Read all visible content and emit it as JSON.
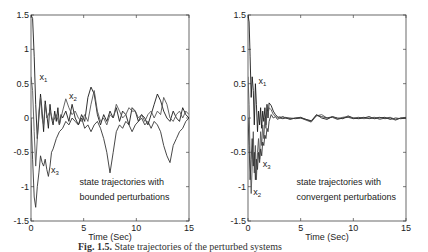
{
  "caption": {
    "prefix": "Fig. 1.5.",
    "text": "State trajectories of the perturbed systems"
  },
  "chart_data": [
    {
      "type": "line",
      "title": "",
      "xlabel": "Time (Sec)",
      "ylabel": "",
      "xlim": [
        0,
        15
      ],
      "ylim": [
        -1.5,
        1.5
      ],
      "xticks": [
        0,
        5,
        10,
        15
      ],
      "xtick_labels": [
        "0",
        "5",
        "10",
        "15"
      ],
      "yticks": [
        1.5,
        1,
        0.5,
        0,
        -0.5,
        -1,
        -1.5
      ],
      "ytick_labels": [
        "1.5",
        "1",
        "0.5",
        "0",
        "-0.5",
        "-1",
        "-1.5"
      ],
      "grid": false,
      "annotation": [
        "state trajectories with",
        "bounded perturbations"
      ],
      "series_labels": [
        {
          "name": "x",
          "sub": "1",
          "at": [
            0.8,
            0.55
          ]
        },
        {
          "name": "x",
          "sub": "2",
          "at": [
            3.6,
            0.28
          ]
        },
        {
          "name": "x",
          "sub": "3",
          "at": [
            1.9,
            -0.8
          ]
        }
      ],
      "series": [
        {
          "name": "x1",
          "x": [
            0,
            0.15,
            0.3,
            0.45,
            0.6,
            0.75,
            0.9,
            1.05,
            1.2,
            1.35,
            1.5,
            1.65,
            1.8,
            1.95,
            2.1,
            2.25,
            2.4,
            2.55,
            2.7,
            2.85,
            3.0,
            3.3,
            3.6,
            3.9,
            4.2,
            4.5,
            4.8,
            5.1,
            5.4,
            5.7,
            6.0,
            6.3,
            6.6,
            6.9,
            7.2,
            7.5,
            7.8,
            8.1,
            8.4,
            8.7,
            9.0,
            9.3,
            9.6,
            9.9,
            10.2,
            10.5,
            10.8,
            11.1,
            11.4,
            11.7,
            12.0,
            12.3,
            12.6,
            12.9,
            13.2,
            13.5,
            13.8,
            14.1,
            14.4,
            14.7,
            15.0
          ],
          "y": [
            1.5,
            1.45,
            0.9,
            0.2,
            -0.3,
            0.0,
            0.35,
            0.1,
            -0.2,
            0.25,
            0.05,
            -0.15,
            0.2,
            0.0,
            -0.1,
            0.1,
            -0.05,
            0.15,
            -0.1,
            0.05,
            0.0,
            0.1,
            -0.05,
            0.2,
            0.0,
            -0.1,
            0.05,
            -0.05,
            0.3,
            0.45,
            0.35,
            0.05,
            -0.1,
            0.05,
            -0.05,
            0.1,
            0.0,
            0.15,
            -0.05,
            0.1,
            0.05,
            -0.1,
            0.15,
            0.1,
            -0.05,
            0.05,
            0.0,
            -0.1,
            0.05,
            0.2,
            0.35,
            0.25,
            0.1,
            0.0,
            -0.05,
            0.1,
            0.0,
            -0.05,
            0.15,
            0.05,
            0.0
          ]
        },
        {
          "name": "x2",
          "x": [
            0,
            0.15,
            0.3,
            0.45,
            0.6,
            0.75,
            0.9,
            1.05,
            1.2,
            1.35,
            1.5,
            1.8,
            2.1,
            2.4,
            2.7,
            3.0,
            3.3,
            3.6,
            3.9,
            4.2,
            4.5,
            4.8,
            5.1,
            5.4,
            5.7,
            6.0,
            6.3,
            6.6,
            6.9,
            7.2,
            7.5,
            7.8,
            8.1,
            8.4,
            8.7,
            9.0,
            9.3,
            9.6,
            9.9,
            10.2,
            10.5,
            10.8,
            11.1,
            11.4,
            11.7,
            12.0,
            12.3,
            12.6,
            12.9,
            13.2,
            13.5,
            13.8,
            14.1,
            14.4,
            14.7,
            15.0
          ],
          "y": [
            0.6,
            0.4,
            -0.2,
            -0.7,
            -0.3,
            0.1,
            0.3,
            0.0,
            -0.1,
            0.2,
            0.0,
            0.1,
            -0.05,
            0.05,
            -0.1,
            0.1,
            0.28,
            0.15,
            0.05,
            0.1,
            0.0,
            -0.05,
            0.05,
            -0.05,
            0.2,
            0.4,
            0.1,
            -0.05,
            0.0,
            -0.1,
            0.05,
            0.0,
            0.2,
            0.1,
            0.0,
            0.05,
            0.15,
            0.1,
            0.1,
            0.0,
            0.05,
            -0.05,
            0.05,
            0.1,
            0.0,
            0.1,
            0.05,
            0.3,
            0.2,
            0.0,
            -0.05,
            0.05,
            0.1,
            0.0,
            0.1,
            0.05
          ]
        },
        {
          "name": "x3",
          "x": [
            0,
            0.15,
            0.3,
            0.45,
            0.6,
            0.75,
            0.9,
            1.05,
            1.2,
            1.35,
            1.5,
            1.65,
            1.8,
            1.95,
            2.1,
            2.4,
            2.7,
            3.0,
            3.3,
            3.6,
            3.9,
            4.2,
            4.5,
            4.8,
            5.1,
            5.4,
            5.7,
            6.0,
            6.3,
            6.6,
            6.9,
            7.2,
            7.5,
            7.8,
            8.1,
            8.4,
            8.7,
            9.0,
            9.3,
            9.6,
            9.9,
            10.2,
            10.5,
            10.8,
            11.1,
            11.4,
            11.7,
            12.0,
            12.3,
            12.6,
            12.9,
            13.2,
            13.5,
            13.8,
            14.1,
            14.4,
            14.7,
            15.0
          ],
          "y": [
            0.0,
            -0.6,
            -1.15,
            -1.3,
            -1.0,
            -0.8,
            -0.55,
            -0.65,
            -0.7,
            -0.6,
            -0.75,
            -0.85,
            -0.7,
            -0.5,
            -0.45,
            -0.3,
            -0.2,
            -0.15,
            -0.05,
            -0.1,
            0.0,
            -0.05,
            -0.1,
            0.0,
            -0.15,
            -0.1,
            -0.2,
            -0.1,
            -0.05,
            -0.15,
            -0.3,
            -0.5,
            -0.8,
            -0.5,
            -0.2,
            -0.1,
            -0.15,
            -0.05,
            -0.1,
            -0.2,
            -0.1,
            -0.05,
            0.0,
            -0.1,
            -0.05,
            -0.15,
            -0.05,
            -0.1,
            -0.2,
            -0.4,
            -0.55,
            -0.65,
            -0.4,
            -0.3,
            -0.2,
            -0.15,
            -0.05,
            0.0
          ]
        }
      ]
    },
    {
      "type": "line",
      "title": "",
      "xlabel": "Time (Sec)",
      "ylabel": "",
      "xlim": [
        0,
        15
      ],
      "ylim": [
        -1.5,
        1.5
      ],
      "xticks": [
        0,
        5,
        10,
        15
      ],
      "xtick_labels": [
        "0",
        "5",
        "10",
        "15"
      ],
      "yticks": [
        1.5,
        1,
        0.5,
        0,
        -0.5,
        -1,
        -1.5
      ],
      "ytick_labels": [
        "1.5",
        "1",
        "0.5",
        "0",
        "-0.5",
        "-1",
        "-1.5"
      ],
      "grid": false,
      "annotation": [
        "state trajectories with",
        "convergent perturbations"
      ],
      "series_labels": [
        {
          "name": "x",
          "sub": "1",
          "at": [
            1.0,
            0.5
          ]
        },
        {
          "name": "x",
          "sub": "3",
          "at": [
            1.4,
            -0.72
          ]
        },
        {
          "name": "x",
          "sub": "2",
          "at": [
            0.5,
            -1.12
          ]
        }
      ],
      "series": [
        {
          "name": "x1",
          "x": [
            0,
            0.1,
            0.2,
            0.3,
            0.4,
            0.5,
            0.6,
            0.7,
            0.8,
            0.9,
            1.0,
            1.1,
            1.2,
            1.3,
            1.4,
            1.5,
            1.6,
            1.7,
            1.8,
            1.9,
            2.0,
            2.2,
            2.4,
            2.6,
            2.8,
            3.0,
            3.3,
            3.6,
            4.0,
            4.5,
            5.0,
            5.5,
            6.0,
            6.5,
            7.0,
            7.5,
            8.0,
            8.5,
            9.0,
            9.5,
            10.0,
            10.5,
            11.0,
            11.5,
            12.0,
            12.5,
            13.0,
            13.5,
            14.0,
            14.5,
            15.0
          ],
          "y": [
            1.5,
            1.4,
            0.9,
            0.3,
            0.6,
            0.4,
            -0.1,
            0.5,
            0.2,
            -0.2,
            0.1,
            -0.1,
            0.15,
            -0.15,
            0.1,
            -0.05,
            0.15,
            -0.1,
            0.2,
            0.0,
            0.22,
            0.18,
            0.1,
            0.05,
            0.02,
            0.0,
            0.02,
            0.0,
            -0.02,
            0.0,
            0.01,
            -0.02,
            -0.05,
            0.05,
            0.0,
            -0.02,
            0.02,
            0.0,
            -0.01,
            0.03,
            0.0,
            -0.01,
            0.0,
            0.02,
            -0.01,
            0.0,
            0.01,
            -0.02,
            0.0,
            -0.01,
            0.0
          ]
        },
        {
          "name": "x2",
          "x": [
            0,
            0.1,
            0.2,
            0.3,
            0.4,
            0.5,
            0.6,
            0.7,
            0.8,
            0.9,
            1.0,
            1.1,
            1.2,
            1.3,
            1.4,
            1.5,
            1.6,
            1.7,
            1.8,
            1.9,
            2.0,
            2.2,
            2.4,
            2.6,
            2.8,
            3.0,
            3.3,
            3.6,
            4.0,
            4.5,
            5.0,
            5.5,
            6.0,
            6.5,
            7.0,
            7.5,
            8.0,
            8.5,
            9.0,
            9.5,
            10.0,
            10.5,
            11.0,
            11.5,
            12.0,
            12.5,
            13.0,
            13.5,
            14.0,
            14.5,
            15.0
          ],
          "y": [
            0.6,
            0.2,
            -0.6,
            -1.1,
            -0.7,
            -0.2,
            -0.8,
            -0.4,
            -0.9,
            -0.5,
            -0.3,
            -0.6,
            -0.2,
            -0.4,
            -0.1,
            -0.3,
            0.0,
            -0.15,
            0.1,
            0.05,
            0.15,
            0.12,
            0.05,
            0.03,
            0.0,
            0.02,
            0.0,
            0.01,
            -0.01,
            0.0,
            0.0,
            -0.03,
            -0.06,
            0.03,
            0.05,
            0.0,
            0.02,
            -0.01,
            0.01,
            0.02,
            0.0,
            0.01,
            -0.01,
            0.0,
            0.01,
            -0.02,
            0.0,
            0.01,
            -0.02,
            0.0,
            0.01
          ]
        },
        {
          "name": "x3",
          "x": [
            0,
            0.1,
            0.2,
            0.3,
            0.4,
            0.5,
            0.6,
            0.7,
            0.8,
            0.9,
            1.0,
            1.1,
            1.2,
            1.3,
            1.4,
            1.5,
            1.6,
            1.7,
            1.8,
            1.9,
            2.0,
            2.2,
            2.4,
            2.6,
            2.8,
            3.0,
            3.3,
            3.6,
            4.0,
            4.5,
            5.0,
            5.5,
            6.0,
            6.5,
            7.0,
            7.5,
            8.0,
            8.5,
            9.0,
            9.5,
            10.0,
            10.5,
            11.0,
            11.5,
            12.0,
            12.5,
            13.0,
            13.5,
            14.0,
            14.5,
            15.0
          ],
          "y": [
            0.0,
            -0.4,
            -0.9,
            -0.6,
            -0.3,
            -0.7,
            -0.5,
            -0.9,
            -0.6,
            -0.75,
            -0.5,
            -0.65,
            -0.45,
            -0.55,
            -0.35,
            -0.4,
            -0.25,
            -0.3,
            -0.15,
            -0.2,
            -0.05,
            0.05,
            0.0,
            0.02,
            -0.02,
            0.0,
            -0.01,
            0.0,
            0.0,
            -0.01,
            0.0,
            -0.02,
            -0.04,
            0.04,
            0.02,
            0.0,
            0.01,
            -0.02,
            0.0,
            0.01,
            -0.01,
            0.0,
            0.01,
            -0.01,
            0.0,
            0.01,
            -0.01,
            0.0,
            -0.03,
            0.0,
            0.0
          ]
        }
      ]
    }
  ]
}
